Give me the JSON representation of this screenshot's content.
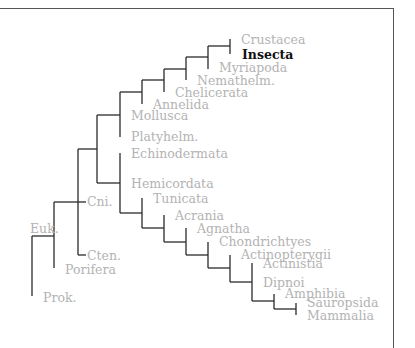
{
  "figure": {
    "type": "phylogenetic-tree",
    "highlighted_taxon": "Insecta",
    "colors": {
      "branch": "#2a2a2a",
      "label": "#b3b3b3",
      "highlight": "#111111",
      "frame": "#555555"
    }
  },
  "labels": {
    "crustacea": "Crustacea",
    "insecta": "Insecta",
    "myriapoda": "Myriapoda",
    "nemathelm": "Nemathelm.",
    "chelicerata": "Chelicerata",
    "annelida": "Annelida",
    "mollusca": "Mollusca",
    "platyhelm": "Platyhelm.",
    "echinodermata": "Echinodermata",
    "hemicordata": "Hemicordata",
    "tunicata": "Tunicata",
    "acrania": "Acrania",
    "agnatha": "Agnatha",
    "chondrichtyes": "Chondrichtyes",
    "actinopterygii": "Actinopterygii",
    "actinistia": "Actinistia",
    "dipnoi": "Dipnoi",
    "amphibia": "Amphibia",
    "sauropsida": "Sauropsida",
    "mammalia": "Mammalia",
    "cni": "Cni.",
    "cten": "Cten.",
    "euk": "Euk.",
    "porifera": "Porifera",
    "prok": "Prok."
  }
}
